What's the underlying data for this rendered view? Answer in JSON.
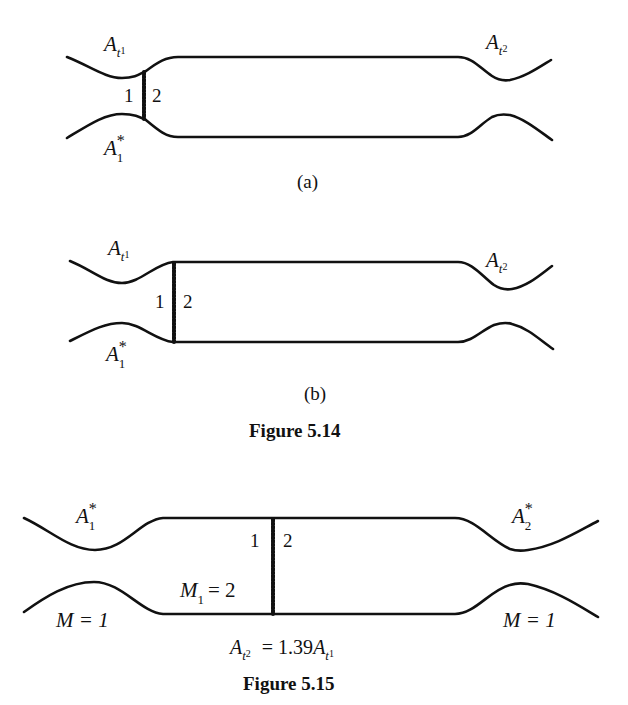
{
  "figures": [
    {
      "id": "fig-5-14a",
      "labels": {
        "inlet_throat": "A",
        "inlet_throat_sub": "t",
        "inlet_throat_subsub": "1",
        "exit_throat": "A",
        "exit_throat_sub": "t",
        "exit_throat_subsub": "2",
        "sonic_area": "A",
        "sonic_area_sub": "1",
        "sonic_area_sup": "*",
        "upstream_side": "1",
        "downstream_side": "2"
      },
      "sublabel": "(a)"
    },
    {
      "id": "fig-5-14b",
      "labels": {
        "inlet_throat": "A",
        "inlet_throat_sub": "t",
        "inlet_throat_subsub": "1",
        "exit_throat": "A",
        "exit_throat_sub": "t",
        "exit_throat_subsub": "2",
        "sonic_area": "A",
        "sonic_area_sub": "1",
        "sonic_area_sup": "*",
        "upstream_side": "1",
        "downstream_side": "2"
      },
      "sublabel": "(b)"
    }
  ],
  "caption_5_14": "Figure 5.14",
  "figure_5_15": {
    "labels": {
      "inlet_sonic": "A",
      "inlet_sonic_sub": "1",
      "inlet_sonic_sup": "*",
      "exit_sonic": "A",
      "exit_sonic_sub": "2",
      "exit_sonic_sup": "*",
      "upstream_side": "1",
      "downstream_side": "2",
      "mach_upstream": "M",
      "mach_upstream_sub": "1",
      "mach_upstream_value": "= 2",
      "inlet_mach": "M = 1",
      "exit_mach": "M = 1"
    },
    "equation": {
      "lhs": "A",
      "lhs_sub": "t",
      "lhs_subsub": "2",
      "rhs_prefix": "= 1.39",
      "rhs": "A",
      "rhs_sub": "t",
      "rhs_subsub": "1"
    },
    "caption": "Figure 5.15"
  }
}
